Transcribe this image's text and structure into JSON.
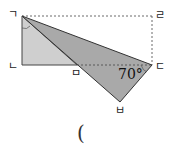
{
  "figure": {
    "points": {
      "giyeok": {
        "label": "ㄱ",
        "x": 22,
        "y": 16
      },
      "nieun": {
        "label": "ㄴ",
        "x": 22,
        "y": 65
      },
      "digeut": {
        "label": "ㄷ",
        "x": 152,
        "y": 65
      },
      "rieul": {
        "label": "ㄹ",
        "x": 152,
        "y": 16
      },
      "mieum": {
        "label": "ㅁ",
        "x": 77,
        "y": 65
      },
      "bieup": {
        "label": "ㅂ",
        "x": 120,
        "y": 102
      }
    },
    "angle_label": "70°",
    "colors": {
      "light_fill": "#cfcfcf",
      "dark_fill": "#a9a9a9",
      "stroke": "#333333"
    }
  },
  "answer_blank": "("
}
